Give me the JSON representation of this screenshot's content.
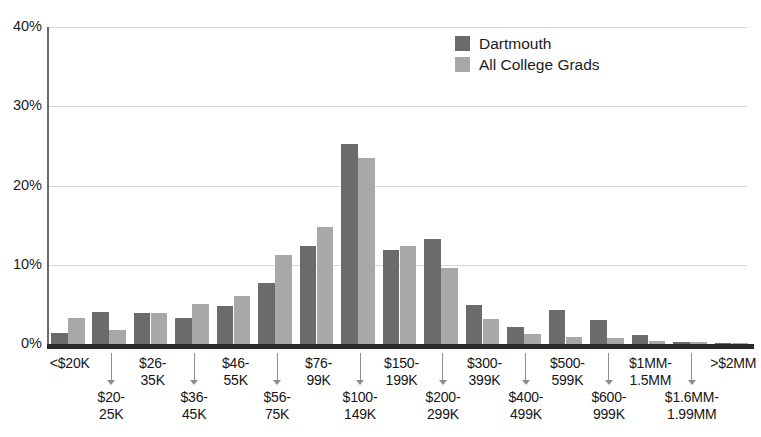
{
  "chart_data": {
    "type": "bar",
    "title": "",
    "subtitle": "",
    "xlabel": "",
    "ylabel": "",
    "ylim": [
      0,
      40
    ],
    "yticks": [
      "0%",
      "10%",
      "20%",
      "30%",
      "40%"
    ],
    "ytick_values": [
      0,
      10,
      20,
      30,
      40
    ],
    "grid": true,
    "legend_position": "top-center-right",
    "categories": [
      "<$20K",
      "$20-\n25K",
      "$26-\n35K",
      "$36-\n45K",
      "$46-\n55K",
      "$56-\n75K",
      "$76-\n99K",
      "$100-\n149K",
      "$150-\n199K",
      "$200-\n299K",
      "$300-\n399K",
      "$400-\n499K",
      "$500-\n599K",
      "$600-\n999K",
      "$1MM-\n1.5MM",
      "$1.6MM-\n1.99MM",
      ">$2MM"
    ],
    "category_labels": [
      {
        "line1": "<$20K",
        "line2": "",
        "row": "top"
      },
      {
        "line1": "$20-",
        "line2": "25K",
        "row": "bottom"
      },
      {
        "line1": "$26-",
        "line2": "35K",
        "row": "top"
      },
      {
        "line1": "$36-",
        "line2": "45K",
        "row": "bottom"
      },
      {
        "line1": "$46-",
        "line2": "55K",
        "row": "top"
      },
      {
        "line1": "$56-",
        "line2": "75K",
        "row": "bottom"
      },
      {
        "line1": "$76-",
        "line2": "99K",
        "row": "top"
      },
      {
        "line1": "$100-",
        "line2": "149K",
        "row": "bottom"
      },
      {
        "line1": "$150-",
        "line2": "199K",
        "row": "top"
      },
      {
        "line1": "$200-",
        "line2": "299K",
        "row": "bottom"
      },
      {
        "line1": "$300-",
        "line2": "399K",
        "row": "top"
      },
      {
        "line1": "$400-",
        "line2": "499K",
        "row": "bottom"
      },
      {
        "line1": "$500-",
        "line2": "599K",
        "row": "top"
      },
      {
        "line1": "$600-",
        "line2": "999K",
        "row": "bottom"
      },
      {
        "line1": "$1MM-",
        "line2": "1.5MM",
        "row": "top"
      },
      {
        "line1": "$1.6MM-",
        "line2": "1.99MM",
        "row": "bottom"
      },
      {
        "line1": ">$2MM",
        "line2": "",
        "row": "top"
      }
    ],
    "series": [
      {
        "name": "Dartmouth",
        "color": "#6b6b6b",
        "values": [
          1.4,
          4.0,
          3.9,
          3.3,
          4.8,
          7.7,
          12.4,
          25.2,
          11.9,
          13.3,
          4.9,
          2.2,
          4.3,
          3.0,
          1.2,
          0.3,
          0.1
        ]
      },
      {
        "name": "All College Grads",
        "color": "#a8a8a8",
        "values": [
          3.3,
          1.8,
          3.9,
          5.1,
          6.0,
          11.2,
          14.8,
          23.5,
          12.4,
          9.6,
          3.2,
          1.3,
          0.9,
          0.8,
          0.4,
          0.2,
          0.1
        ]
      }
    ]
  },
  "legend": {
    "entries": [
      {
        "label": "Dartmouth",
        "color": "#6b6b6b"
      },
      {
        "label": "All College Grads",
        "color": "#a8a8a8"
      }
    ]
  },
  "axis": {
    "y_ticks": [
      "40%",
      "30%",
      "20%",
      "10%",
      "0%"
    ]
  },
  "colors": {
    "series_dark": "#6b6b6b",
    "series_light": "#a8a8a8",
    "gridline": "#d8d8d8",
    "axis": "#2a2a2a",
    "text": "#1b1b1b",
    "arrow": "#8d8d8d",
    "background": "#ffffff"
  }
}
